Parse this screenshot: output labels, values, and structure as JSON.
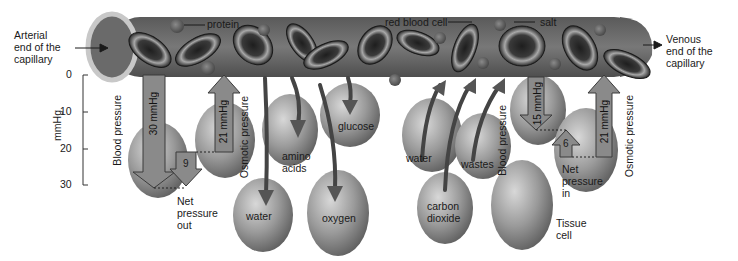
{
  "diagram": {
    "title_left": "Arterial end of the capillary",
    "left_end": {
      "line1": "Arterial",
      "line2": "end of the",
      "line3": "capillary"
    },
    "right_end": {
      "line1": "Venous",
      "line2": "end of the",
      "line3": "capillary"
    },
    "capillary_labels": {
      "protein": "protein",
      "red_blood_cell": "red blood cell",
      "salt": "salt"
    },
    "axis": {
      "label": "mmHg",
      "ticks": [
        "0",
        "10",
        "20",
        "30"
      ]
    },
    "arterial_side": {
      "blood_pressure_label": "Blood pressure",
      "blood_pressure_value": "30 mmHg",
      "osmotic_pressure_label": "Osmotic pressure",
      "osmotic_pressure_value": "21 mmHg",
      "net_value": "9",
      "net_label": {
        "line1": "Net",
        "line2": "pressure",
        "line3": "out"
      }
    },
    "venous_side": {
      "blood_pressure_label": "Blood pressure",
      "blood_pressure_value": "15 mmHg",
      "osmotic_pressure_label": "Osmotic pressure",
      "osmotic_pressure_value": "21 mmHg",
      "net_value": "6",
      "net_label": {
        "line1": "Net",
        "line2": "pressure",
        "line3": "in"
      }
    },
    "substances_out": [
      "water",
      "amino acids",
      "glucose",
      "oxygen"
    ],
    "cell_labels": {
      "water_out": "water",
      "amino": {
        "line1": "amino",
        "line2": "acids"
      },
      "glucose": "glucose",
      "oxygen": "oxygen",
      "water_in": "water",
      "wastes": "wastes",
      "co2": {
        "line1": "carbon",
        "line2": "dioxide"
      },
      "tissue": {
        "line1": "Tissue",
        "line2": "cell"
      }
    },
    "colors": {
      "capillary": "#6f6f6f",
      "arrow_fill": "#8a8a8a",
      "arrow_stroke": "#3a3a3a",
      "cell": "#9a9a9a",
      "background": "#ffffff"
    }
  }
}
